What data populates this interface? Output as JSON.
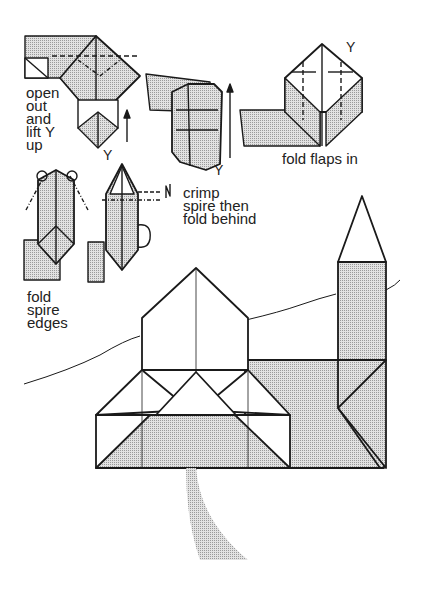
{
  "colors": {
    "ink": "#1a1a1a",
    "shade": "#c8c8c8",
    "paper": "#ffffff"
  },
  "steps": [
    {
      "id": "step-open-out",
      "label_lines": [
        "open",
        "out",
        "and",
        "lift Y",
        "up"
      ],
      "marker": "Y"
    },
    {
      "id": "step-lift",
      "marker": "Y"
    },
    {
      "id": "step-fold-flaps",
      "label": "fold flaps in",
      "marker": "Y"
    },
    {
      "id": "step-fold-spire-edges",
      "label_lines": [
        "fold",
        "spire",
        "edges"
      ]
    },
    {
      "id": "step-crimp",
      "label_lines": [
        "crimp",
        "spire then",
        "fold behind"
      ]
    }
  ],
  "final_model": {
    "name": "church"
  }
}
